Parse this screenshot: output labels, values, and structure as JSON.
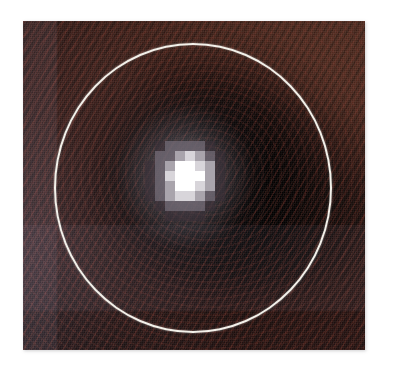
{
  "figure": {
    "kind": "astronomical-image",
    "caption": "",
    "canvas": {
      "width": 394,
      "height": 383,
      "background": "#ffffff"
    },
    "image_panel": {
      "left": 23,
      "top": 21,
      "width": 342,
      "height": 329,
      "border_shadow": "#96969b",
      "background_colors": {
        "upper_right_brown": "#4d2b20",
        "mid_brown": "#3a1f19",
        "dark_core": "#0a0505",
        "near_black": "#020101",
        "cool_purple_cast": "#4a4656",
        "stripe_red": "#84362a"
      },
      "texture": "diagonal scan-line banding with elliptical contour rings"
    },
    "aperture_circle": {
      "label": "aperture-circle",
      "color": "#f3f1ea",
      "stroke_width": 2.4,
      "center_x": 193,
      "center_y": 188,
      "radius_x": 139,
      "radius_y": 145
    },
    "point_source": {
      "label": "point-source",
      "center_x": 185,
      "center_y": 176,
      "pixel_size": 10,
      "grid": [
        [
          0,
          0,
          0,
          0,
          0,
          0,
          0,
          0
        ],
        [
          0,
          1,
          2,
          2,
          2,
          2,
          1,
          0
        ],
        [
          0,
          2,
          2,
          3,
          4,
          3,
          2,
          1
        ],
        [
          1,
          2,
          3,
          5,
          5,
          4,
          3,
          1
        ],
        [
          1,
          2,
          4,
          5,
          5,
          5,
          3,
          1
        ],
        [
          1,
          2,
          3,
          5,
          5,
          4,
          3,
          1
        ],
        [
          1,
          2,
          3,
          4,
          4,
          3,
          2,
          1
        ],
        [
          0,
          1,
          2,
          2,
          2,
          2,
          1,
          0
        ],
        [
          0,
          0,
          1,
          1,
          1,
          1,
          0,
          0
        ]
      ],
      "level_colors": [
        "#1a1114",
        "#3a3038",
        "#6e6672",
        "#a9a4ac",
        "#d8d5da",
        "#ffffff"
      ]
    }
  }
}
